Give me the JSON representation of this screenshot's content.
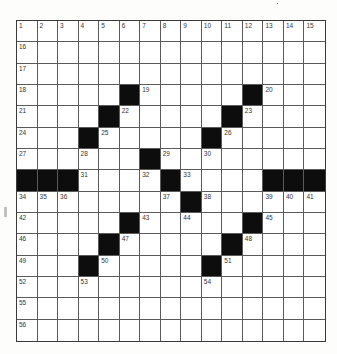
{
  "puzzle": {
    "rows": 15,
    "cols": 15,
    "colors": {
      "black": "#0d0d0d",
      "white": "#ffffff",
      "line": "#5a5a5a"
    },
    "grid": [
      "...............",
      "...............",
      "...............",
      ".....#.....#...",
      "....#.....#....",
      "...#.....#.....",
      "......#........",
      "###....#....###",
      "........#......",
      ".....#.....#...",
      "....#.....#....",
      "...#.....#.....",
      "...............",
      "...............",
      "..............."
    ],
    "numbers": [
      {
        "r": 0,
        "c": 0,
        "n": "1"
      },
      {
        "r": 0,
        "c": 1,
        "n": "2"
      },
      {
        "r": 0,
        "c": 2,
        "n": "3"
      },
      {
        "r": 0,
        "c": 3,
        "n": "4"
      },
      {
        "r": 0,
        "c": 4,
        "n": "5"
      },
      {
        "r": 0,
        "c": 5,
        "n": "6"
      },
      {
        "r": 0,
        "c": 6,
        "n": "7"
      },
      {
        "r": 0,
        "c": 7,
        "n": "8"
      },
      {
        "r": 0,
        "c": 8,
        "n": "9"
      },
      {
        "r": 0,
        "c": 9,
        "n": "10"
      },
      {
        "r": 0,
        "c": 10,
        "n": "11"
      },
      {
        "r": 0,
        "c": 11,
        "n": "12"
      },
      {
        "r": 0,
        "c": 12,
        "n": "13"
      },
      {
        "r": 0,
        "c": 13,
        "n": "14"
      },
      {
        "r": 0,
        "c": 14,
        "n": "15"
      },
      {
        "r": 1,
        "c": 0,
        "n": "16"
      },
      {
        "r": 2,
        "c": 0,
        "n": "17"
      },
      {
        "r": 3,
        "c": 0,
        "n": "18"
      },
      {
        "r": 3,
        "c": 6,
        "n": "19"
      },
      {
        "r": 3,
        "c": 12,
        "n": "20"
      },
      {
        "r": 4,
        "c": 0,
        "n": "21"
      },
      {
        "r": 4,
        "c": 5,
        "n": "22"
      },
      {
        "r": 4,
        "c": 11,
        "n": "23"
      },
      {
        "r": 5,
        "c": 0,
        "n": "24"
      },
      {
        "r": 5,
        "c": 4,
        "n": "25"
      },
      {
        "r": 5,
        "c": 10,
        "n": "26"
      },
      {
        "r": 6,
        "c": 0,
        "n": "27"
      },
      {
        "r": 6,
        "c": 3,
        "n": "28"
      },
      {
        "r": 6,
        "c": 7,
        "n": "29"
      },
      {
        "r": 6,
        "c": 9,
        "n": "30"
      },
      {
        "r": 7,
        "c": 3,
        "n": "31"
      },
      {
        "r": 7,
        "c": 6,
        "n": "32"
      },
      {
        "r": 7,
        "c": 8,
        "n": "33"
      },
      {
        "r": 8,
        "c": 0,
        "n": "34"
      },
      {
        "r": 8,
        "c": 1,
        "n": "35"
      },
      {
        "r": 8,
        "c": 2,
        "n": "36"
      },
      {
        "r": 8,
        "c": 7,
        "n": "37"
      },
      {
        "r": 8,
        "c": 9,
        "n": "38"
      },
      {
        "r": 8,
        "c": 12,
        "n": "39"
      },
      {
        "r": 8,
        "c": 13,
        "n": "40"
      },
      {
        "r": 8,
        "c": 14,
        "n": "41"
      },
      {
        "r": 9,
        "c": 0,
        "n": "42"
      },
      {
        "r": 9,
        "c": 6,
        "n": "43"
      },
      {
        "r": 9,
        "c": 8,
        "n": "44"
      },
      {
        "r": 9,
        "c": 12,
        "n": "45"
      },
      {
        "r": 10,
        "c": 0,
        "n": "46"
      },
      {
        "r": 10,
        "c": 5,
        "n": "47"
      },
      {
        "r": 10,
        "c": 11,
        "n": "48"
      },
      {
        "r": 11,
        "c": 0,
        "n": "49"
      },
      {
        "r": 11,
        "c": 4,
        "n": "50"
      },
      {
        "r": 11,
        "c": 10,
        "n": "51"
      },
      {
        "r": 12,
        "c": 0,
        "n": "52"
      },
      {
        "r": 12,
        "c": 3,
        "n": "53"
      },
      {
        "r": 12,
        "c": 9,
        "n": "54"
      },
      {
        "r": 13,
        "c": 0,
        "n": "55"
      },
      {
        "r": 14,
        "c": 0,
        "n": "56"
      }
    ]
  }
}
